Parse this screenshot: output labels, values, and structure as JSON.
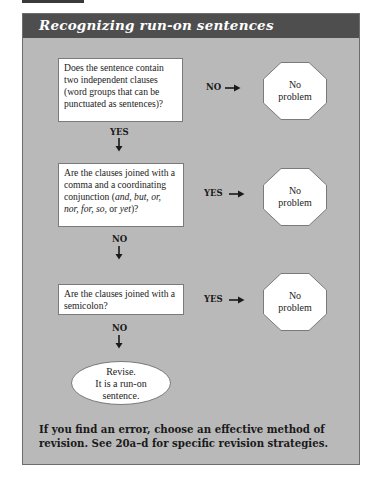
{
  "title": "Recognizing run-on sentences",
  "colors": {
    "header_bg": "#4e4e4e",
    "card_bg": "#b9b9b9",
    "box_bg": "#ffffff"
  },
  "flowchart": {
    "questions": [
      {
        "text_parts": [
          {
            "text": "Does the sentence contain two independent clauses (word groups that can be punctuated as sentences)?",
            "italic": false
          }
        ],
        "down_label": "YES",
        "side_label": "NO",
        "side_outcome": "No problem"
      },
      {
        "text_parts": [
          {
            "text": "Are the clauses joined with a comma and a coordinating conjunction (",
            "italic": false
          },
          {
            "text": "and, but, or, nor, for, so,",
            "italic": true
          },
          {
            "text": " or ",
            "italic": false
          },
          {
            "text": "yet",
            "italic": true
          },
          {
            "text": ")?",
            "italic": false
          }
        ],
        "down_label": "NO",
        "side_label": "YES",
        "side_outcome": "No problem"
      },
      {
        "text_parts": [
          {
            "text": "Are the clauses joined with a semicolon?",
            "italic": false
          }
        ],
        "down_label": "NO",
        "side_label": "YES",
        "side_outcome": "No problem"
      }
    ],
    "final_outcome": {
      "line1": "Revise.",
      "line2": "It is a run-on",
      "line3": "sentence."
    },
    "octagon_line1": "No",
    "octagon_line2": "problem"
  },
  "footer": "If you find an error, choose an effective method of revision. See 20a–d for specific revision strategies."
}
